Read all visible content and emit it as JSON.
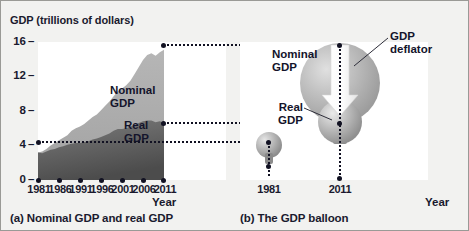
{
  "figure": {
    "panel_a_caption": "(a) Nominal GDP and real GDP",
    "panel_b_caption": "(b) The GDP balloon"
  },
  "panel_a": {
    "y_axis_title_main": "GDP",
    "y_axis_title_paren": "(trillions of dollars)",
    "x_axis_label": "Year",
    "series_label_nominal_line1": "Nominal",
    "series_label_nominal_line2": "GDP",
    "series_label_real_line1": "Real",
    "series_label_real_line2": "GDP"
  },
  "panel_b": {
    "x_axis_label": "Year",
    "label_nominal_line1": "Nominal",
    "label_nominal_line2": "GDP",
    "label_real_line1": "Real",
    "label_real_line2": "GDP",
    "label_deflator_line1": "GDP",
    "label_deflator_line2": "deflator",
    "year_start": "1981",
    "year_end": "2011"
  },
  "colors": {
    "nominal_fill": "#adadad",
    "real_fill": "#6e6e6e",
    "balloon_large": "#b4b4b4",
    "balloon_small": "#a8a8a8",
    "text": "#1a1a2e",
    "page_background": "#f2f2f0",
    "plot_background": "#ffffff"
  },
  "chart_data": {
    "type": "area",
    "title": "GDP (trillions of dollars)",
    "xlabel": "Year",
    "ylabel": "GDP (trillions of dollars)",
    "xlim": [
      1981,
      2011
    ],
    "ylim": [
      0,
      16
    ],
    "yticks": [
      0,
      4,
      8,
      12,
      16
    ],
    "xticks": [
      1981,
      1986,
      1991,
      1996,
      2001,
      2006,
      2011
    ],
    "grid": false,
    "legend": "inline-labels",
    "stacked": false,
    "x": [
      1981,
      1982,
      1983,
      1984,
      1985,
      1986,
      1987,
      1988,
      1989,
      1990,
      1991,
      1992,
      1993,
      1994,
      1995,
      1996,
      1997,
      1998,
      1999,
      2000,
      2001,
      2002,
      2003,
      2004,
      2005,
      2006,
      2007,
      2008,
      2009,
      2010,
      2011
    ],
    "series": [
      {
        "name": "Nominal GDP",
        "values": [
          3.2,
          3.3,
          3.6,
          4.0,
          4.3,
          4.6,
          4.9,
          5.2,
          5.7,
          6.0,
          6.2,
          6.5,
          6.9,
          7.3,
          7.6,
          8.1,
          8.6,
          9.1,
          9.7,
          10.3,
          10.6,
          11.0,
          11.5,
          12.3,
          13.1,
          13.9,
          14.5,
          14.7,
          14.4,
          14.8,
          15.1
        ]
      },
      {
        "name": "Real GDP",
        "values": [
          3.2,
          3.1,
          3.3,
          3.5,
          3.6,
          3.8,
          3.9,
          4.1,
          4.2,
          4.3,
          4.3,
          4.4,
          4.5,
          4.7,
          4.8,
          5.0,
          5.2,
          5.4,
          5.7,
          5.9,
          5.9,
          6.0,
          6.2,
          6.4,
          6.6,
          6.8,
          6.9,
          6.9,
          6.7,
          6.8,
          6.6
        ]
      }
    ],
    "annotations": [
      {
        "label": "Nominal GDP 2011",
        "value": 15.1
      },
      {
        "label": "Real GDP 2011",
        "value": 6.6
      },
      {
        "label": "GDP 1981",
        "value": 3.2
      }
    ],
    "balloon": {
      "description": "GDP balloon: balloon size represents nominal GDP; inner sphere represents real GDP; GDP deflator deflates nominal to real.",
      "points": [
        {
          "year": 1981,
          "nominal_gdp": 3.2,
          "real_gdp": 3.2
        },
        {
          "year": 2011,
          "nominal_gdp": 15.1,
          "real_gdp": 6.6
        }
      ]
    }
  }
}
